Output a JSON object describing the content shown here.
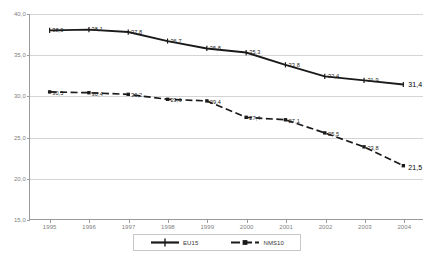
{
  "chart_data": {
    "type": "line",
    "title": "",
    "xlabel": "",
    "ylabel": "",
    "categories": [
      "1995",
      "1996",
      "1997",
      "1998",
      "1999",
      "2000",
      "2001",
      "2002",
      "2003",
      "2004"
    ],
    "series": [
      {
        "name": "EU15",
        "style": "solid",
        "marker": "cross",
        "values": [
          38.0,
          38.1,
          37.8,
          36.7,
          35.8,
          35.3,
          33.8,
          32.4,
          31.9,
          31.4
        ],
        "labels": [
          "38,0",
          "38,1",
          "37,8",
          "36,7",
          "35,8",
          "35,3",
          "33,8",
          "32,4",
          "31,9",
          "31,4"
        ]
      },
      {
        "name": "NMS10",
        "style": "dashed",
        "marker": "square",
        "values": [
          30.5,
          30.4,
          30.2,
          29.6,
          29.4,
          27.4,
          27.1,
          25.5,
          23.8,
          21.5
        ],
        "labels": [
          "30,5",
          "30,4",
          "30,2",
          "29,6",
          "29,4",
          "27,4",
          "27,1",
          "25,5",
          "23,8",
          "21,5"
        ]
      }
    ],
    "ylim": [
      15.0,
      40.0
    ],
    "yticks": [
      40.0,
      35.0,
      30.0,
      25.0,
      20.0,
      15.0
    ],
    "ytick_labels": [
      "40,0",
      "35,0",
      "30,0",
      "25,0",
      "20,0",
      "15,0"
    ],
    "grid": true,
    "legend_position": "bottom"
  },
  "legend": {
    "items": [
      {
        "label": "EU15",
        "color": "#1a1a1a",
        "style": "solid"
      },
      {
        "label": "NMS10",
        "color": "#1a1a1a",
        "style": "dashed"
      }
    ]
  },
  "colors": {
    "eu15": "#1a1a1a",
    "nms10": "#1a1a1a",
    "grid": "#d4d4d4",
    "axis": "#9a9a9a",
    "tick_text": "#808080"
  }
}
